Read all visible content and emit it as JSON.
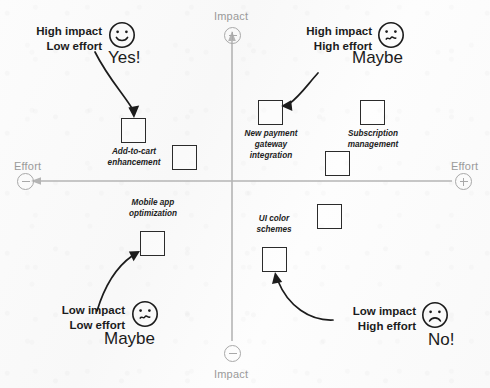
{
  "diagram": {
    "background_color": "#fbfbfb",
    "axis_color": "#b4b4b4",
    "box_color": "#2b2b2b",
    "text_color": "#1c1c1c",
    "label_color": "#9a9a9a"
  },
  "axes": {
    "vertical": {
      "name": "impact-axis",
      "top_label": "Impact",
      "top_sign": "+",
      "bottom_label": "Impact",
      "bottom_sign": "−"
    },
    "horizontal": {
      "name": "effort-axis",
      "left_label": "Effort",
      "left_sign": "−",
      "right_label": "Effort",
      "right_sign": "+"
    }
  },
  "callouts": [
    {
      "id": "high-impact-low-effort",
      "line1": "High impact",
      "line2": "Low effort",
      "verdict": "Yes!",
      "face": "smiley-happy-icon",
      "quadrant": "top-left"
    },
    {
      "id": "high-impact-high-effort",
      "line1": "High impact",
      "line2": "High effort",
      "verdict": "Maybe",
      "face": "smiley-unsure-icon",
      "quadrant": "top-right"
    },
    {
      "id": "low-impact-low-effort",
      "line1": "Low impact",
      "line2": "Low effort",
      "verdict": "Maybe",
      "face": "smiley-unsure-icon",
      "quadrant": "bottom-left"
    },
    {
      "id": "low-impact-high-effort",
      "line1": "Low impact",
      "line2": "High effort",
      "verdict": "No!",
      "face": "smiley-sad-icon",
      "quadrant": "bottom-right"
    }
  ],
  "items": [
    {
      "id": "add-to-cart-enhancement",
      "label": "Add-to-cart\nenhancement",
      "quadrant": "top-left",
      "labelled": true
    },
    {
      "id": "new-payment-gateway-integration",
      "label": "New payment\ngateway\nintegration",
      "quadrant": "top-right",
      "labelled": true
    },
    {
      "id": "subscription-management",
      "label": "Subscription\nmanagement",
      "quadrant": "top-right",
      "labelled": true
    },
    {
      "id": "mobile-app-optimization",
      "label": "Mobile app\noptimization",
      "quadrant": "bottom-left",
      "labelled": true
    },
    {
      "id": "ui-color-schemes",
      "label": "UI color\nschemes",
      "quadrant": "bottom-right",
      "labelled": true
    },
    {
      "id": "unlabelled-item-1",
      "label": "",
      "quadrant": "top-left",
      "labelled": false
    },
    {
      "id": "unlabelled-item-2",
      "label": "",
      "quadrant": "top-right",
      "labelled": false
    },
    {
      "id": "unlabelled-item-3",
      "label": "",
      "quadrant": "bottom-right",
      "labelled": false
    }
  ]
}
